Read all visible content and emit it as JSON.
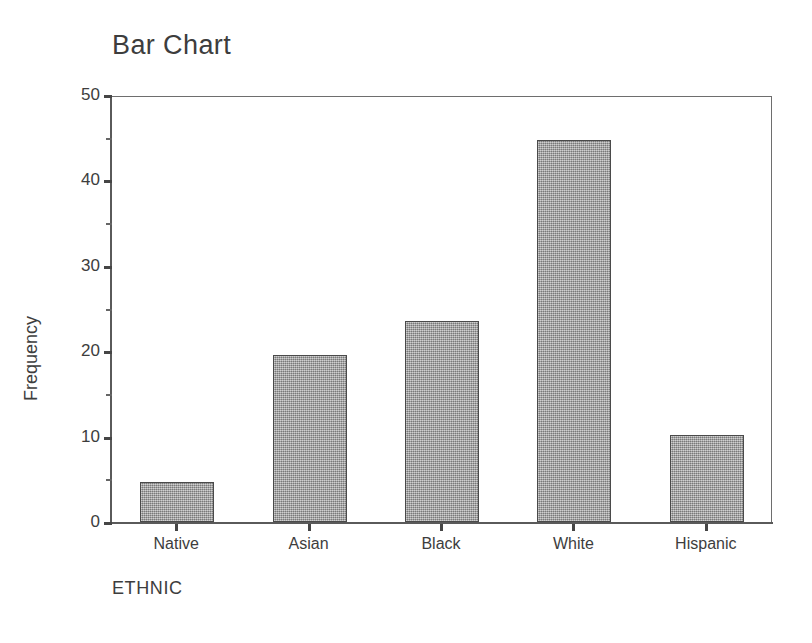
{
  "chart_data": {
    "type": "bar",
    "title": "Bar Chart",
    "xlabel": "ETHNIC",
    "ylabel": "Frequency",
    "categories": [
      "Native",
      "Asian",
      "Black",
      "White",
      "Hispanic"
    ],
    "values": [
      4.7,
      19.5,
      23.5,
      44.7,
      10.2
    ],
    "ylim": [
      0,
      50
    ],
    "yticks": [
      0,
      10,
      20,
      30,
      40,
      50
    ],
    "ytick_labels": [
      "0",
      "10",
      "20",
      "30",
      "40",
      "50"
    ],
    "yticks_minor": [
      5,
      15,
      25,
      35,
      45
    ],
    "grid": false,
    "legend": false,
    "bar_color": "#9d9d9d",
    "bar_edge_color": "#4a4a4a",
    "axis_color": "#5a5a5a",
    "text_color": "#3d3d3d",
    "background": "#ffffff"
  }
}
